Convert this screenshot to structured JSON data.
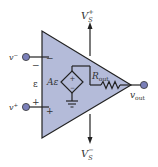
{
  "diagram": {
    "labels": {
      "v_minus": "v",
      "v_minus_sup": "−",
      "v_plus": "v",
      "v_plus_sup": "+",
      "epsilon": "ε",
      "gain": "Aε",
      "r_out": "R",
      "r_out_sub": "out",
      "v_out": "v",
      "v_out_sub": "out",
      "vs_plus": "V",
      "vs_plus_sup": "+",
      "vs_plus_sub": "S",
      "vs_minus": "V",
      "vs_minus_sup": "−",
      "vs_minus_sub": "S",
      "sign_minus_outside": "−",
      "sign_minus_inside": "−",
      "sign_plus_outside": "+",
      "sign_plus_inside": "+",
      "source_plus": "+",
      "source_minus": "−"
    },
    "colors": {
      "triangle_fill": "#b4bbd9",
      "stroke": "#222222",
      "terminal": "#7a7fb8"
    }
  }
}
